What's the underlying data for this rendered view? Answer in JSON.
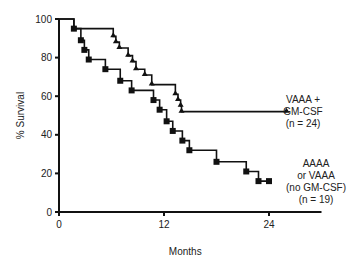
{
  "chart_data": {
    "type": "line",
    "subtype": "kaplan-meier step",
    "title": "",
    "xlabel": "Months",
    "ylabel": "% Survival",
    "xlim": [
      0,
      30
    ],
    "ylim": [
      0,
      100
    ],
    "xticks": [
      0,
      12,
      24
    ],
    "yticks": [
      0,
      20,
      40,
      60,
      80,
      100
    ],
    "grid": false,
    "series": [
      {
        "name": "VAAA + GM-CSF (n = 24)",
        "label_lines": [
          "VAAA +",
          "GM-CSF",
          "(n = 24)"
        ],
        "marker": "triangle",
        "x": [
          0,
          1.7,
          6.2,
          6.5,
          6.9,
          7.9,
          8.4,
          8.8,
          9.8,
          10.6,
          13.3,
          13.6,
          13.9,
          14.0,
          26.0
        ],
        "y": [
          100,
          95,
          91,
          88,
          85,
          81,
          78,
          74,
          71,
          66,
          61,
          58,
          55,
          52,
          52
        ]
      },
      {
        "name": "AAAA or VAAA (no GM-CSF) (n = 19)",
        "label_lines": [
          "AAAA",
          "or VAAA",
          "(no GM-CSF)",
          "(n = 19)"
        ],
        "marker": "square",
        "x": [
          0,
          1.7,
          2.5,
          2.9,
          3.4,
          5.3,
          7.0,
          8.3,
          10.8,
          11.5,
          12.3,
          13.0,
          14.1,
          14.9,
          18.0,
          21.4,
          22.8,
          24.0
        ],
        "y": [
          100,
          95,
          89,
          84,
          79,
          74,
          68,
          63,
          58,
          53,
          47,
          42,
          37,
          32,
          26,
          21,
          16,
          16
        ]
      }
    ]
  },
  "axis": {
    "xlabel": "Months",
    "ylabel": "% Survival",
    "yticks": [
      "0",
      "20",
      "40",
      "60",
      "80",
      "100"
    ],
    "xticks": [
      "0",
      "12",
      "24"
    ]
  },
  "legend": {
    "gm": [
      "VAAA +",
      "GM-CSF",
      "(n = 24)"
    ],
    "no_gm": [
      "AAAA",
      "or VAAA",
      "(no GM-CSF)",
      "(n = 19)"
    ]
  }
}
